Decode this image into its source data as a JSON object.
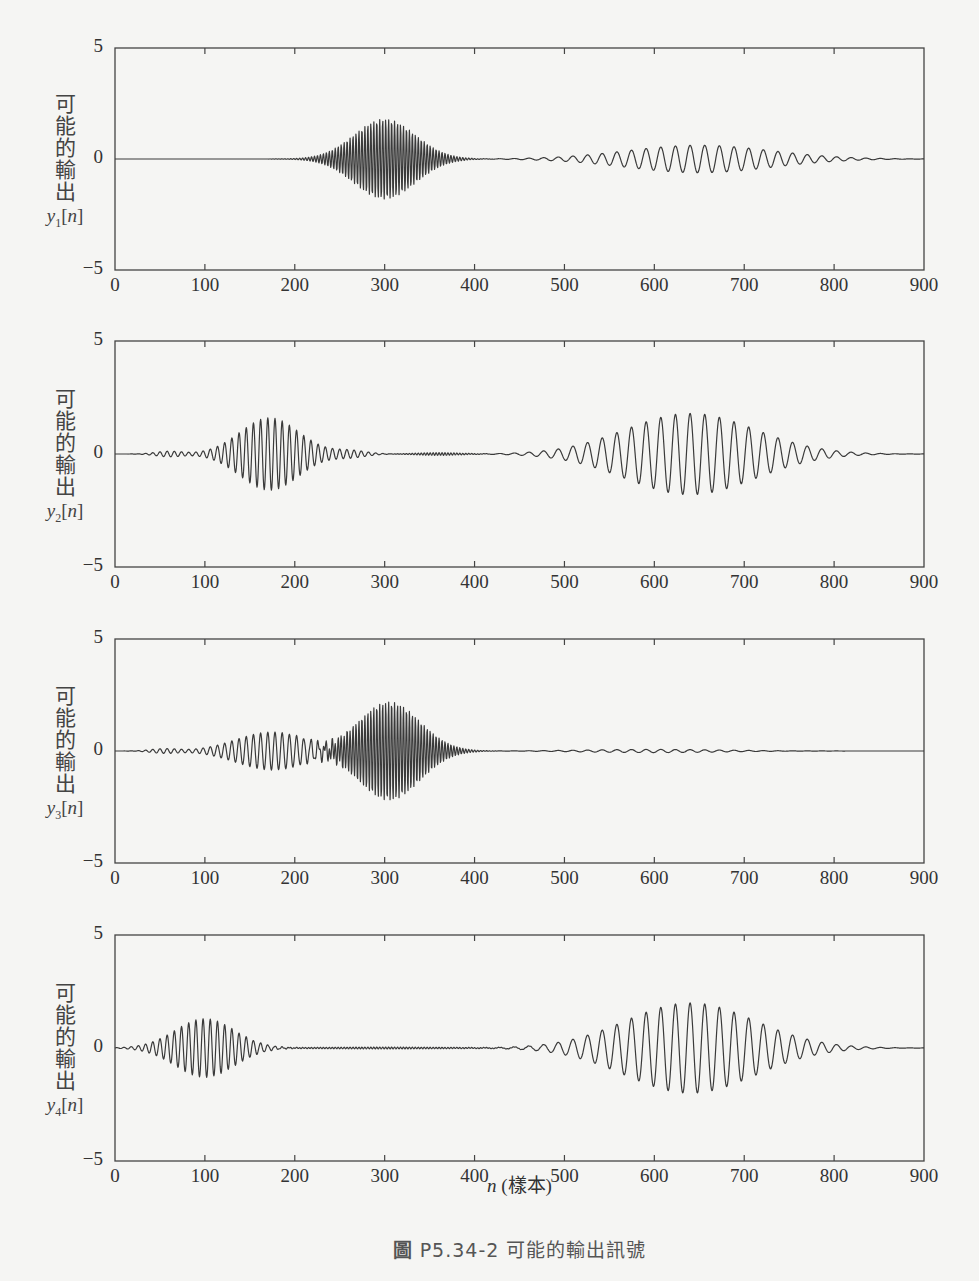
{
  "figure": {
    "caption_prefix": "圖",
    "caption_id": "P5.34-2",
    "caption_text": "可能的輸出訊號",
    "xlabel_var": "n",
    "xlabel_unit": "(樣本)",
    "ylabel_text": "可能的輸出"
  },
  "axes_common": {
    "xlim": [
      0,
      900
    ],
    "ylim": [
      -5,
      5
    ],
    "xticks": [
      "0",
      "100",
      "200",
      "300",
      "400",
      "500",
      "600",
      "700",
      "800",
      "900"
    ],
    "yticks": [
      "5",
      "0",
      "−5"
    ],
    "x_px": [
      115,
      924
    ]
  },
  "chart_data": [
    {
      "type": "line",
      "title": "",
      "ylabel": "可能的輸出 y1[n]",
      "xlabel": "",
      "xlim": [
        0,
        900
      ],
      "ylim": [
        -5,
        5
      ],
      "grid": false,
      "symbol": "y",
      "subscript": "1",
      "px": {
        "top": 48,
        "bottom": 270
      },
      "packets": [
        {
          "center": 300,
          "sigma": 34,
          "amp": 1.8,
          "period": 3.3
        },
        {
          "center": 650,
          "sigma": 80,
          "amp": 0.62,
          "period": 16.3
        }
      ],
      "description": "High-frequency packet centered near n=300 (peak ≈ ±1.8); low-frequency packet centered near n=650 (peak ≈ ±0.6)"
    },
    {
      "type": "line",
      "title": "",
      "ylabel": "可能的輸出 y2[n]",
      "xlabel": "",
      "xlim": [
        0,
        900
      ],
      "ylim": [
        -5,
        5
      ],
      "grid": false,
      "symbol": "y",
      "subscript": "2",
      "px": {
        "top": 341,
        "bottom": 567
      },
      "packets": [
        {
          "center": 60,
          "sigma": 15,
          "amp": 0.12,
          "period": 8
        },
        {
          "center": 172,
          "sigma": 33,
          "amp": 1.6,
          "period": 8
        },
        {
          "center": 262,
          "sigma": 18,
          "amp": 0.15,
          "period": 8
        },
        {
          "center": 360,
          "sigma": 25,
          "amp": 0.06,
          "period": 3.3
        },
        {
          "center": 640,
          "sigma": 72,
          "amp": 1.8,
          "period": 16.3
        }
      ],
      "description": "Mid-frequency packet centered near n=170 (peak ≈ ±1.6); low-frequency packet centered near n=640 (peak ≈ ±1.8)"
    },
    {
      "type": "line",
      "title": "",
      "ylabel": "可能的輸出 y3[n]",
      "xlabel": "",
      "xlim": [
        0,
        900
      ],
      "ylim": [
        -5,
        5
      ],
      "grid": false,
      "symbol": "y",
      "subscript": "3",
      "px": {
        "top": 639,
        "bottom": 863
      },
      "packets": [
        {
          "center": 55,
          "sigma": 15,
          "amp": 0.1,
          "period": 8
        },
        {
          "center": 175,
          "sigma": 40,
          "amp": 0.85,
          "period": 8
        },
        {
          "center": 305,
          "sigma": 34,
          "amp": 2.2,
          "period": 3.3
        },
        {
          "center": 600,
          "sigma": 75,
          "amp": 0.07,
          "period": 16.3
        }
      ],
      "description": "Mid-frequency packet near n=175 (peak ≈ ±0.8) overlapping a high-frequency packet near n=305 (peak ≈ ±2.2); tiny low-frequency ripple near n=600"
    },
    {
      "type": "line",
      "title": "",
      "ylabel": "可能的輸出 y4[n]",
      "xlabel": "n (樣本)",
      "xlim": [
        0,
        900
      ],
      "ylim": [
        -5,
        5
      ],
      "grid": false,
      "symbol": "y",
      "subscript": "4",
      "px": {
        "top": 935,
        "bottom": 1161
      },
      "packets": [
        {
          "center": 100,
          "sigma": 33,
          "amp": 1.3,
          "period": 8
        },
        {
          "center": 300,
          "sigma": 90,
          "amp": 0.04,
          "period": 3.3
        },
        {
          "center": 640,
          "sigma": 72,
          "amp": 2.0,
          "period": 16.3
        }
      ],
      "description": "Mid-frequency packet centered near n=100 (peak ≈ ±1.3); low-frequency packet centered near n=640 (peak ≈ ±2.0)"
    }
  ],
  "style": {
    "line_color": "#3a3a3a",
    "axis_color": "#444444",
    "background": "#f5f5f3"
  }
}
